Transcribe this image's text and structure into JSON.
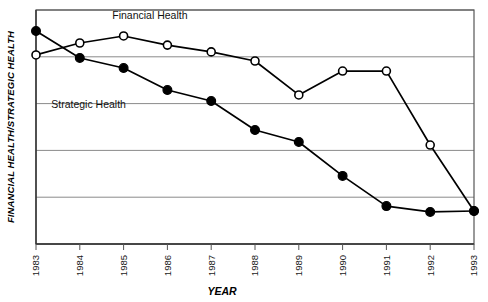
{
  "chart_data": {
    "type": "line",
    "title": "",
    "xlabel": "YEAR",
    "ylabel": "FINANCIAL HEALTH/STRATEGIC HEALTH",
    "categories": [
      "1983",
      "1984",
      "1985",
      "1986",
      "1987",
      "1988",
      "1989",
      "1990",
      "1991",
      "1992",
      "1993"
    ],
    "x": [
      1983,
      1984,
      1985,
      1986,
      1987,
      1988,
      1989,
      1990,
      1991,
      1992,
      1993
    ],
    "xlim": [
      1983,
      1993
    ],
    "ylim": [
      0,
      100
    ],
    "grid": true,
    "gridlines_y": [
      0,
      20,
      40,
      60,
      80,
      100
    ],
    "y_tick_labels_shown": false,
    "legend_position": "inline-annotations",
    "series": [
      {
        "name": "Financial Health",
        "marker": "open-circle",
        "color": "#000000",
        "label_x": 1985.6,
        "label_y": 96,
        "values": [
          80.8,
          85.9,
          88.9,
          85.0,
          82.1,
          78.2,
          63.7,
          73.9,
          73.9,
          42.3,
          14.1
        ]
      },
      {
        "name": "Strategic Health",
        "marker": "filled-circle",
        "color": "#000000",
        "label_x": 1984.2,
        "label_y": 58,
        "values": [
          91.0,
          79.5,
          75.2,
          65.8,
          61.1,
          48.7,
          43.6,
          29.1,
          16.2,
          13.7,
          14.1
        ]
      }
    ],
    "annotations": [
      {
        "text": "Financial Health",
        "name": "financial-health-label"
      },
      {
        "text": "Strategic Health",
        "name": "strategic-health-label"
      }
    ]
  },
  "axis": {
    "y_title": "FINANCIAL HEALTH/STRATEGIC HEALTH",
    "x_title": "YEAR"
  },
  "colors": {
    "grid": "#8a8a8a",
    "frame": "#555555",
    "line": "#000000",
    "marker_open_fill": "#ffffff",
    "marker_filled_fill": "#000000",
    "background": "#ffffff"
  }
}
